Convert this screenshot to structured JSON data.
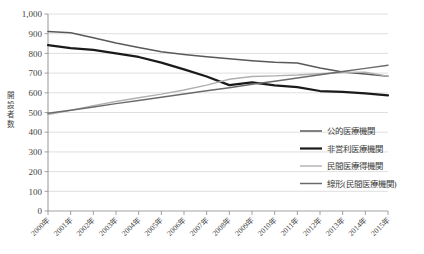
{
  "chart_data": {
    "type": "line",
    "title": "",
    "xlabel": "",
    "ylabel": "開設者数",
    "ylim": [
      0,
      1000
    ],
    "ytick_step": 100,
    "grid": true,
    "legend_position": "inside-right",
    "categories": [
      "2000年",
      "2001年",
      "2002年",
      "2003年",
      "2004年",
      "2005年",
      "2006年",
      "2007年",
      "2008年",
      "2009年",
      "2010年",
      "2011年",
      "2012年",
      "2013年",
      "2014年",
      "2015年"
    ],
    "ytick_labels": [
      "0",
      "100",
      "200",
      "300",
      "400",
      "500",
      "600",
      "700",
      "800",
      "900",
      "1,000"
    ],
    "series": [
      {
        "name": "公的医療機関",
        "color": "#595959",
        "width": 1.5,
        "values": [
          911,
          905,
          879,
          853,
          830,
          808,
          795,
          783,
          773,
          763,
          755,
          751,
          726,
          706,
          695,
          684
        ]
      },
      {
        "name": "非営利医療機関",
        "color": "#1a1a1a",
        "width": 2.2,
        "values": [
          842,
          827,
          818,
          800,
          782,
          753,
          719,
          683,
          639,
          653,
          638,
          629,
          609,
          605,
          597,
          587
        ]
      },
      {
        "name": "民間医療得機関",
        "color": "#b0b0b0",
        "width": 1.4,
        "values": [
          489,
          511,
          535,
          556,
          575,
          593,
          614,
          639,
          669,
          683,
          686,
          690,
          697,
          703,
          705,
          684
        ]
      },
      {
        "name": "線形(民間医療機関)",
        "color": "#6b6b6b",
        "width": 1.5,
        "values": [
          496,
          512,
          528,
          545,
          561,
          577,
          594,
          610,
          626,
          643,
          659,
          675,
          692,
          708,
          724,
          740
        ]
      }
    ]
  },
  "legend": {
    "items": [
      {
        "label": "公的医療機関"
      },
      {
        "label": "非営利医療機関"
      },
      {
        "label": "民間医療得機関"
      },
      {
        "label": "線形(民間医療機関)"
      }
    ]
  },
  "axis": {
    "y_title": "開設者数"
  }
}
